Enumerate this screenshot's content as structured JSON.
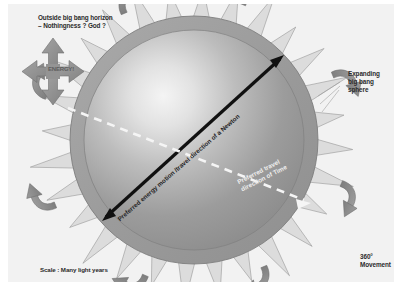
{
  "diagram": {
    "title_concept": "Expanding big bang sphere diagram",
    "background_color": "#f2f2f2",
    "sphere_ring_color": "#9a9a9a",
    "sphere_body_color": "#8e8e8e",
    "sphere_highlight_color": "#efefef",
    "spike_color": "#a6a6a6",
    "curved_arrow_color": "#8c8c8c",
    "black_arrow_color": "#111111",
    "white_arrow_color": "#f5f5f5"
  },
  "labels": {
    "outside": "Outside big bang horizon\n– Nothingness ? God ?",
    "energy": "ENERGY!",
    "expanding": "Expanding\nbig bang\nsphere",
    "movement": "360°\nMovement",
    "scale": "Scale : Many light years",
    "energy_motion_arrow": "Preferred energy motion /travel direction of a Newton",
    "time_arrow": "Preferred travel\ndirection of Time"
  },
  "geometry": {
    "sphere_center_x": 195,
    "sphere_center_y": 140,
    "sphere_outer_radius": 125,
    "sphere_inner_radius": 110,
    "spike_count": 28,
    "curved_arrow_count": 8
  }
}
